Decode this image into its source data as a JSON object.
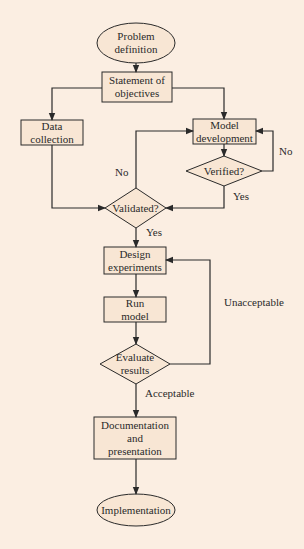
{
  "colors": {
    "background": "#fbeee2",
    "node_fill": "#f8e6d4",
    "stroke": "#2a2a2a"
  },
  "nodes": {
    "problem_definition": {
      "shape": "ellipse",
      "lines": [
        "Problem",
        "definition"
      ]
    },
    "statement_of_objectives": {
      "shape": "rect",
      "lines": [
        "Statement of",
        "objectives"
      ]
    },
    "data_collection": {
      "shape": "rect",
      "lines": [
        "Data",
        "collection"
      ]
    },
    "model_development": {
      "shape": "rect",
      "lines": [
        "Model",
        "development"
      ]
    },
    "verified": {
      "shape": "diamond",
      "lines": [
        "Verified?"
      ]
    },
    "validated": {
      "shape": "diamond",
      "lines": [
        "Validated?"
      ]
    },
    "design_experiments": {
      "shape": "rect",
      "lines": [
        "Design",
        "experiments"
      ]
    },
    "run_model": {
      "shape": "rect",
      "lines": [
        "Run",
        "model"
      ]
    },
    "evaluate_results": {
      "shape": "diamond",
      "lines": [
        "Evaluate",
        "results"
      ]
    },
    "documentation_and_presentation": {
      "shape": "rect",
      "lines": [
        "Documentation",
        "and",
        "presentation"
      ]
    },
    "implementation": {
      "shape": "ellipse",
      "lines": [
        "Implementation"
      ]
    }
  },
  "edge_labels": {
    "verified_no": "No",
    "verified_yes": "Yes",
    "validated_no": "No",
    "validated_yes": "Yes",
    "evaluate_unacceptable": "Unacceptable",
    "evaluate_acceptable": "Acceptable"
  },
  "edges": [
    {
      "from": "Problem definition",
      "to": "Statement of objectives"
    },
    {
      "from": "Statement of objectives",
      "to": "Data collection"
    },
    {
      "from": "Statement of objectives",
      "to": "Model development"
    },
    {
      "from": "Model development",
      "to": "Verified?"
    },
    {
      "from": "Verified?",
      "to": "Model development",
      "label": "No"
    },
    {
      "from": "Verified?",
      "to": "Validated?",
      "label": "Yes"
    },
    {
      "from": "Data collection",
      "to": "Validated?"
    },
    {
      "from": "Validated?",
      "to": "Model development",
      "label": "No"
    },
    {
      "from": "Validated?",
      "to": "Design experiments",
      "label": "Yes"
    },
    {
      "from": "Design experiments",
      "to": "Run model"
    },
    {
      "from": "Run model",
      "to": "Evaluate results"
    },
    {
      "from": "Evaluate results",
      "to": "Design experiments",
      "label": "Unacceptable"
    },
    {
      "from": "Evaluate results",
      "to": "Documentation and presentation",
      "label": "Acceptable"
    },
    {
      "from": "Documentation and presentation",
      "to": "Implementation"
    }
  ]
}
